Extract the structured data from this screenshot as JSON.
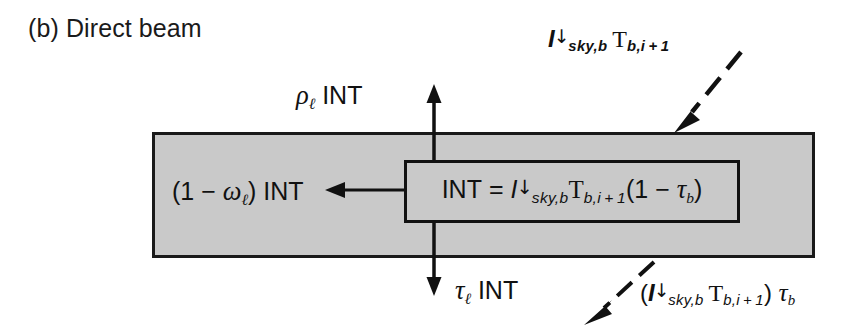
{
  "figure": {
    "panel_caption": "(b) Direct beam",
    "background_color": "#ffffff",
    "slab_fill_color": "#c9c9c9",
    "line_color": "#111111"
  },
  "labels": {
    "reflected_up": {
      "symbol": "ρ",
      "subscript": "ℓ",
      "term": " INT",
      "plain": "ρ_ℓ INT"
    },
    "absorbed_left": {
      "prefix": "(1 − ",
      "symbol": "ω",
      "subscript": "ℓ",
      "suffix": ") INT",
      "plain": "(1 − ω_ℓ) INT"
    },
    "transmitted_down": {
      "symbol": "τ",
      "subscript": "ℓ",
      "term": " INT",
      "plain": "τ_ℓ INT"
    },
    "incoming_beam": {
      "symbol": "I",
      "arrow": "↓",
      "sub1": "sky,b",
      "factor": "T",
      "sub2": "b,i + 1",
      "plain": "I↓_sky,b T_b,i+1"
    },
    "transmitted_beam": {
      "open": "(",
      "symbol": "I",
      "arrow": "↓",
      "sub1": "sky,b",
      "factor": "T",
      "sub2": "b,i + 1",
      "close": ") ",
      "tau": "τ",
      "tau_sub": "b",
      "plain": "(I↓_sky,b T_b,i+1) τ_b"
    }
  },
  "equation": {
    "lhs": "INT",
    "equals": "=",
    "symbol": "I",
    "arrow": "↓",
    "sub1": "sky,b",
    "factor": "T",
    "sub2": "b,i + 1",
    "group_open": "(1 − ",
    "tau": "τ",
    "tau_sub": "b",
    "group_close": ")",
    "plain": "INT = I↓_sky,b T_b,i+1 (1 − τ_b)"
  },
  "arrows": {
    "up_reflected": {
      "name": "up-arrow",
      "x": 434,
      "y_from": 160,
      "y_to": 88
    },
    "down_transmitted": {
      "name": "down-arrow",
      "x": 434,
      "y_from": 222,
      "y_to": 292
    },
    "left_absorbed": {
      "name": "left-arrow",
      "y": 190,
      "x_from": 404,
      "x_to": 327
    },
    "incoming_dashed": {
      "name": "incoming-dashed-arrow",
      "x_from": 740,
      "y_from": 54,
      "x_to": 676,
      "y_to": 131
    },
    "outgoing_dashed": {
      "name": "outgoing-dashed-arrow",
      "x_from": 652,
      "y_from": 264,
      "x_to": 587,
      "y_to": 322
    }
  }
}
